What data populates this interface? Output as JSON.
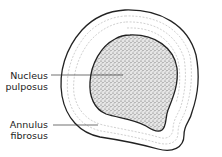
{
  "diagram": {
    "labels": [
      {
        "id": "nucleus",
        "line1": "Nucleus",
        "line2": "pulposus"
      },
      {
        "id": "annulus",
        "line1": "Annulus",
        "line2": "fibrosus"
      }
    ],
    "colors": {
      "outline": "#222222",
      "stipple": "#555555",
      "rings": "#bbbbbb",
      "background": "#ffffff"
    }
  }
}
